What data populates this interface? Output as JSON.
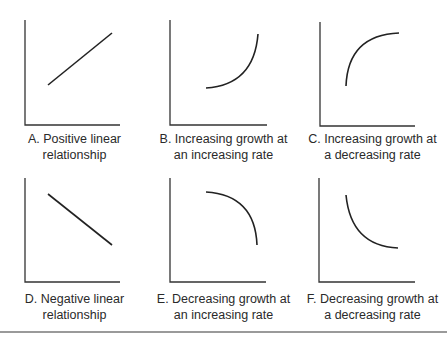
{
  "panels": [
    {
      "id": "A",
      "caption_line1": "A. Positive linear",
      "caption_line2": "relationship",
      "shape": "positive-linear"
    },
    {
      "id": "B",
      "caption_line1": "B. Increasing growth at",
      "caption_line2": "an increasing rate",
      "shape": "convex-increasing"
    },
    {
      "id": "C",
      "caption_line1": "C. Increasing growth at",
      "caption_line2": "a decreasing rate",
      "shape": "concave-increasing"
    },
    {
      "id": "D",
      "caption_line1": "D. Negative linear",
      "caption_line2": "relationship",
      "shape": "negative-linear"
    },
    {
      "id": "E",
      "caption_line1": "E. Decreasing growth at",
      "caption_line2": "an increasing rate",
      "shape": "concave-decreasing"
    },
    {
      "id": "F",
      "caption_line1": "F. Decreasing growth at",
      "caption_line2": "a decreasing rate",
      "shape": "convex-decreasing"
    }
  ],
  "colors": {
    "line": "#222222",
    "axis": "#333333",
    "rule": "#9a9a9a"
  }
}
